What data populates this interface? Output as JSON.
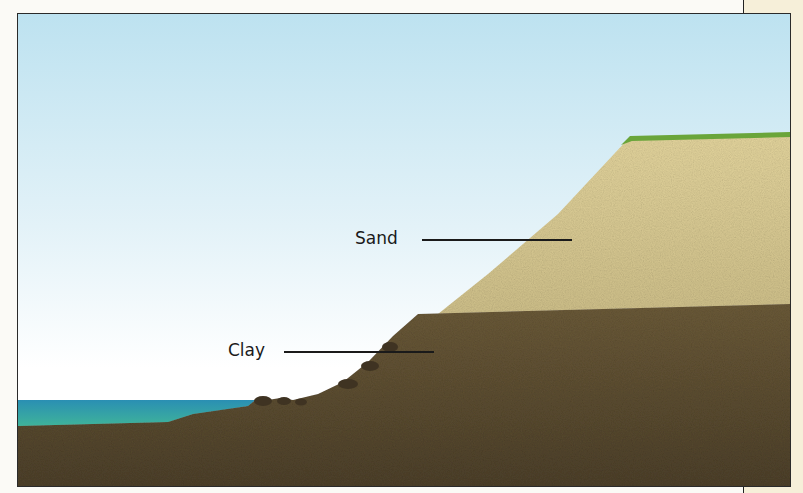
{
  "diagram": {
    "type": "geological cross-section of coastal cliff",
    "labels": [
      {
        "id": "sand",
        "text": "Sand"
      },
      {
        "id": "clay",
        "text": "Clay"
      }
    ],
    "layers": [
      {
        "name": "grass",
        "color": "#6aa53a"
      },
      {
        "name": "sand",
        "color": "#d9cc94"
      },
      {
        "name": "clay",
        "color": "#5b4c32"
      },
      {
        "name": "sea",
        "color": "#2e9bb5"
      },
      {
        "name": "sky",
        "color": "#bfe3f1"
      }
    ]
  }
}
